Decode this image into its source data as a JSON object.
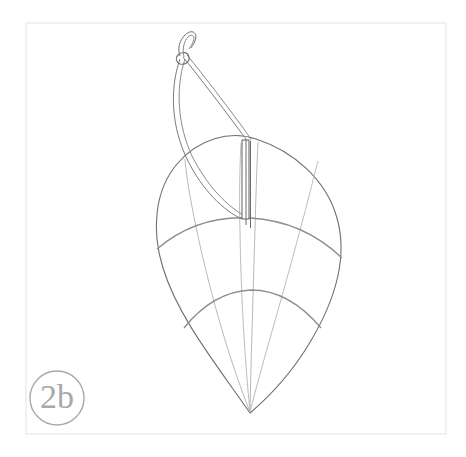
{
  "figure": {
    "label": "2b",
    "background_color": "#ffffff",
    "frame": {
      "stroke_color": "#f0f0f0",
      "stroke_width": 2,
      "x": 25,
      "y": 22,
      "width": 422,
      "height": 413
    },
    "label_badge": {
      "text": "2b",
      "circle_stroke": "#a8a8a8",
      "text_color": "#a8a8a8",
      "center_x": 57,
      "center_y": 398,
      "radius": 27,
      "stroke_width": 1.4
    },
    "colors": {
      "outline": "#6b6b6b",
      "seam": "#b5b5b5",
      "band": "#8f8f8f",
      "rigging": "#767676",
      "pin": "#5d5d5d"
    },
    "geometry": {
      "apex_x": 250,
      "apex_y": 413,
      "canopy_top_y": 139,
      "canopy_left_x": 152,
      "canopy_right_x": 345,
      "band_one_center_y": 222,
      "band_two_center_y": 292,
      "pin_x": 247,
      "pin_top_y": 140,
      "pin_bottom_y": 222,
      "knot_x": 182,
      "knot_y": 58
    }
  },
  "paths": {
    "canopy_outline": "M 250 413 C 215 365 176 318 161 268 C 150 231 153 191 175 165 C 196 140 229 131 255 139 C 292 150 325 178 336 217 C 348 259 332 305 309 343 C 292 371 270 395 250 413 Z",
    "seam_left_outer": "M 250 413 C 232 366 213 300 197 228 C 191 199 187 175 186 158",
    "seam_left_inner": "M 250 413 C 245 362 241 300 239 232 C 238 194 238 162 239 142",
    "seam_center": "M 250 413 C 251 360 253 298 255 230 C 256 193 258 161 259 141",
    "seam_right_inner": "M 250 413 C 262 365 281 303 299 235 C 308 202 315 177 319 162",
    "band_one": "M 158 247 C 185 225 216 216 250 218 C 285 220 316 233 341 257",
    "band_two": "M 185 327 C 205 302 227 291 251 290 C 276 290 299 302 320 327",
    "rigging_straight_a": "M 183 56 C 196 72 219 103 236 126 C 243 135 247 139 248 141",
    "rigging_straight_b": "M 186 54 C 199 70 223 101 240 124 C 247 133 251 138 252 140",
    "rigging_curve_a": "M 180 58 C 170 88 173 127 188 158 C 203 189 224 209 241 218",
    "rigging_curve_b": "M 184 58 C 175 88 178 126 192 156 C 207 186 227 206 244 215",
    "hook_a": "M 181 57 C 179 50 181 42 186 37 C 190 32 194 32 195 36 C 196 40 194 44 192 47",
    "hook_b": "M 184 57 C 182 49 184 41 188 37 C 191 34 193 35 193 38 C 193 41 191 45 189 48",
    "knot_loop": "M 179 55 C 176 58 177 62 181 63 C 186 64 190 61 189 57 C 188 53 183 52 179 55 Z",
    "pin_outer": "M 243 140 L 243 219 L 250 219 L 250 140 Z",
    "pin_inner_line": "M 247 140 L 247 224",
    "pin_shaft": "M 251 141 L 251 227"
  }
}
